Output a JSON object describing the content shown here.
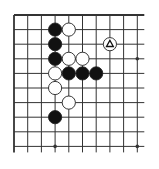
{
  "diagram": {
    "type": "go-board-corner",
    "grid": {
      "columns": 10,
      "rows": 10,
      "edges": [
        "top",
        "left"
      ]
    },
    "colors": {
      "background": "#ffffff",
      "line": "#333333",
      "black_stone": "#111111",
      "white_stone": "#ffffff",
      "stone_outline": "#222222",
      "marker": "#111111"
    },
    "star_points": [
      {
        "col": 3,
        "row": 9
      },
      {
        "col": 9,
        "row": 9
      },
      {
        "col": 9,
        "row": 3
      }
    ],
    "stones": [
      {
        "color": "black",
        "col": 3,
        "row": 1
      },
      {
        "color": "white",
        "col": 4,
        "row": 1
      },
      {
        "color": "black",
        "col": 3,
        "row": 2
      },
      {
        "color": "white",
        "col": 7,
        "row": 2,
        "marker": "triangle"
      },
      {
        "color": "black",
        "col": 3,
        "row": 3
      },
      {
        "color": "white",
        "col": 4,
        "row": 3
      },
      {
        "color": "white",
        "col": 5,
        "row": 3
      },
      {
        "color": "white",
        "col": 3,
        "row": 4
      },
      {
        "color": "black",
        "col": 4,
        "row": 4
      },
      {
        "color": "black",
        "col": 5,
        "row": 4
      },
      {
        "color": "black",
        "col": 6,
        "row": 4
      },
      {
        "color": "white",
        "col": 3,
        "row": 5
      },
      {
        "color": "white",
        "col": 4,
        "row": 6
      },
      {
        "color": "black",
        "col": 3,
        "row": 7
      }
    ]
  }
}
